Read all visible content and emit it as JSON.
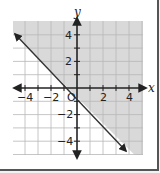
{
  "graph": {
    "title": "",
    "x_axis_label": "x",
    "y_axis_label": "y",
    "origin_label": "O",
    "x_ticks": [
      {
        "value": -4,
        "label": "−4"
      },
      {
        "value": -2,
        "label": "−2"
      },
      {
        "value": 2,
        "label": "2"
      },
      {
        "value": 4,
        "label": "4"
      }
    ],
    "y_ticks": [
      {
        "value": 4,
        "label": "4"
      },
      {
        "value": 2,
        "label": "2"
      },
      {
        "value": -2,
        "label": "−2"
      },
      {
        "value": -4,
        "label": "−4"
      }
    ],
    "range": {
      "x": [
        -5,
        5
      ],
      "y": [
        -5,
        5
      ]
    },
    "boundary_line": {
      "equation": "y = -x - 1",
      "style": "solid",
      "arrows": "both"
    },
    "shaded_region": "above line (y ≥ -x - 1)",
    "colors": {
      "shade": "#d9d9d9",
      "grid": "#b8b8b8",
      "axis": "#222222",
      "line": "#333333"
    }
  }
}
